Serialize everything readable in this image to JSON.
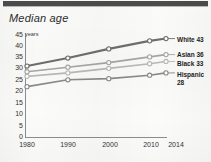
{
  "figure": {
    "title": "Median age",
    "units_label": "years"
  },
  "chart_data": {
    "type": "line",
    "title": "Median age",
    "xlabel": "",
    "ylabel": "years",
    "x": [
      1980,
      1990,
      2000,
      2010,
      2014
    ],
    "xtick_labels": [
      "1980",
      "1990",
      "2000",
      "2010",
      "2014"
    ],
    "ytick_labels": [
      "45",
      "40",
      "35",
      "30",
      "25",
      "20",
      "15",
      "10",
      "5",
      "0"
    ],
    "ytick_values": [
      45,
      40,
      35,
      30,
      25,
      20,
      15,
      10,
      5,
      0
    ],
    "ylim": [
      0,
      45
    ],
    "xlim": [
      1980,
      2014
    ],
    "grid": false,
    "legend_position": "right",
    "series": [
      {
        "name": "White",
        "end_value": 43,
        "legend_label": "White 43",
        "color": "#6e6e6e",
        "values": [
          31,
          34.5,
          38.5,
          42,
          43
        ]
      },
      {
        "name": "Asian",
        "end_value": 36,
        "legend_label": "Asian 36",
        "color": "#a6a6a6",
        "values": [
          28.5,
          30.5,
          32.5,
          35,
          36
        ]
      },
      {
        "name": "Black",
        "end_value": 33,
        "legend_label": "Black 33",
        "color": "#b9b9b9",
        "values": [
          26.5,
          28,
          30,
          32,
          33
        ]
      },
      {
        "name": "Hispanic",
        "end_value": 28,
        "legend_label": "Hispanic 28",
        "legend_label_line1": "Hispanic",
        "legend_label_line2": "28",
        "color": "#8a8a8a",
        "values": [
          22,
          25,
          25.5,
          27,
          28
        ]
      }
    ]
  },
  "yticks": [
    {
      "label": "45"
    },
    {
      "label": "40"
    },
    {
      "label": "35"
    },
    {
      "label": "30"
    },
    {
      "label": "25"
    },
    {
      "label": "20"
    },
    {
      "label": "15"
    },
    {
      "label": "10"
    },
    {
      "label": "5"
    },
    {
      "label": "0"
    }
  ],
  "xticks": [
    {
      "label": "1980"
    },
    {
      "label": "1990"
    },
    {
      "label": "2000"
    },
    {
      "label": "2010"
    },
    {
      "label": "2014"
    }
  ],
  "legend": [
    {
      "label": "White 43"
    },
    {
      "label": "Asian 36"
    },
    {
      "label": "Black 33"
    },
    {
      "label_line1": "Hispanic",
      "label_line2": "28"
    }
  ]
}
